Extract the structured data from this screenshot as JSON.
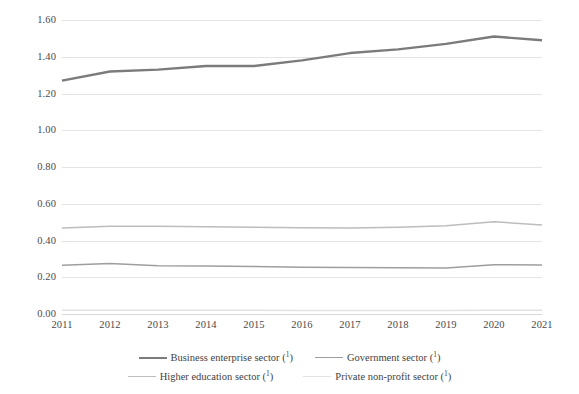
{
  "chart_data": {
    "type": "line",
    "title": "",
    "subtitle": "",
    "xlabel": "",
    "ylabel": "",
    "grid": true,
    "legend_position": "bottom",
    "x": [
      2011,
      2012,
      2013,
      2014,
      2015,
      2016,
      2017,
      2018,
      2019,
      2020,
      2021
    ],
    "categories": [
      "2011",
      "2012",
      "2013",
      "2014",
      "2015",
      "2016",
      "2017",
      "2018",
      "2019",
      "2020",
      "2021"
    ],
    "ylim": [
      0.0,
      1.6
    ],
    "ytick_labels": [
      "1.60",
      "1.40",
      "1.20",
      "1.00",
      "0.80",
      "0.60",
      "0.40",
      "0.20",
      "0.00"
    ],
    "ytick_values": [
      1.6,
      1.4,
      1.2,
      1.0,
      0.8,
      0.6,
      0.4,
      0.2,
      0.0
    ],
    "series": [
      {
        "name": "Business enterprise sector (¹)",
        "label_text": "Business enterprise sector",
        "footnote_marker": "1",
        "color": "#7b7b7b",
        "width": 2.4,
        "values": [
          1.27,
          1.32,
          1.33,
          1.35,
          1.35,
          1.38,
          1.42,
          1.44,
          1.47,
          1.51,
          1.49
        ]
      },
      {
        "name": "Government sector (¹)",
        "label_text": "Government sector",
        "footnote_marker": "1",
        "color": "#9e9e9e",
        "width": 1.5,
        "values": [
          0.265,
          0.275,
          0.262,
          0.261,
          0.259,
          0.255,
          0.253,
          0.252,
          0.251,
          0.268,
          0.267
        ]
      },
      {
        "name": "Higher education sector (¹)",
        "label_text": "Higher education sector",
        "footnote_marker": "1",
        "color": "#bdbdbd",
        "width": 1.5,
        "values": [
          0.468,
          0.477,
          0.477,
          0.475,
          0.472,
          0.47,
          0.468,
          0.472,
          0.48,
          0.502,
          0.484
        ]
      },
      {
        "name": "Private non-profit sector (¹)",
        "label_text": "Private non-profit sector",
        "footnote_marker": "1",
        "color": "#e2e2e2",
        "width": 1.5,
        "values": [
          0.021,
          0.021,
          0.02,
          0.02,
          0.02,
          0.019,
          0.019,
          0.019,
          0.019,
          0.02,
          0.02
        ]
      }
    ]
  },
  "legend": {
    "row1": [
      {
        "label": "Business enterprise sector",
        "marker": "1",
        "color": "#7b7b7b",
        "width": 2.4
      },
      {
        "label": "Government sector",
        "marker": "1",
        "color": "#9e9e9e",
        "width": 1.5
      }
    ],
    "row2": [
      {
        "label": "Higher education sector",
        "marker": "1",
        "color": "#bdbdbd",
        "width": 1.5
      },
      {
        "label": "Private non-profit sector",
        "marker": "1",
        "color": "#e2e2e2",
        "width": 1.5
      }
    ]
  },
  "colors": {
    "gridline": "#e4e4e4",
    "baseline": "#d8d8d8",
    "tick_text": "#4a4a4a",
    "legend_text": "#3f3f3f",
    "background": "#ffffff"
  }
}
